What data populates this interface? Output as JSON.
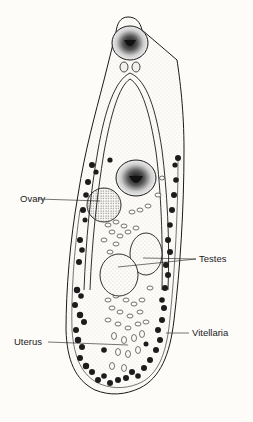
{
  "diagram": {
    "labels": [
      {
        "id": "ovary",
        "text": "Ovary"
      },
      {
        "id": "testes",
        "text": "Testes"
      },
      {
        "id": "uterus",
        "text": "Uterus"
      },
      {
        "id": "vitellaria",
        "text": "Vitellaria"
      }
    ],
    "colors": {
      "background": "#fdfcf9",
      "ink": "#1a1a1a"
    }
  }
}
